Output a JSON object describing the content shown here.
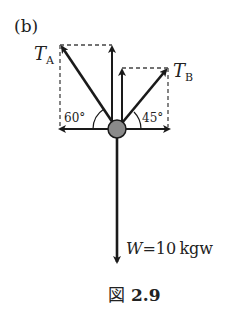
{
  "panel_label": "(b)",
  "forces": {
    "ta": {
      "symbol": "T",
      "subscript": "A"
    },
    "tb": {
      "symbol": "T",
      "subscript": "B"
    },
    "w": {
      "symbol": "W",
      "value": "=10 kgw"
    }
  },
  "angles": {
    "left": "60°",
    "right": "45°"
  },
  "caption": {
    "prefix": "図",
    "number": "2.9"
  },
  "colors": {
    "line": "#1a1a1a",
    "knot": "#8a8a8a",
    "dash": "#444444"
  }
}
